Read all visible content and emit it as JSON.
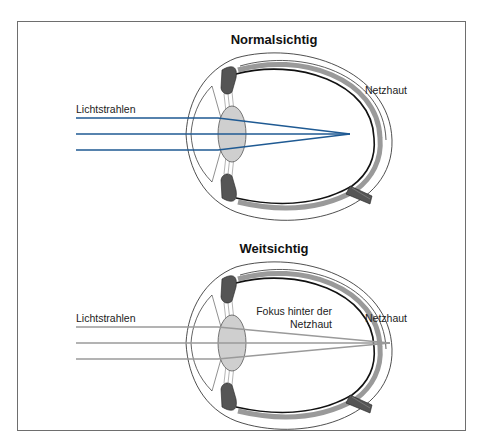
{
  "page": {
    "top_text_fragment": "",
    "colors": {
      "frame": "#6e6e6e",
      "ray_normal": "#1f5a93",
      "ray_far": "#9a9a9a",
      "lens_fill": "#cfcfcf",
      "retina_band": "#9a9a9a"
    }
  },
  "diagrams": [
    {
      "title": "Normalsichtig",
      "left_label": "Lichtstrahlen",
      "right_label": "Netzhaut",
      "focus_label": ""
    },
    {
      "title": "Weitsichtig",
      "left_label": "Lichtstrahlen",
      "right_label": "Netzhaut",
      "focus_label_line1": "Fokus hinter der",
      "focus_label_line2": "Netzhaut"
    }
  ]
}
